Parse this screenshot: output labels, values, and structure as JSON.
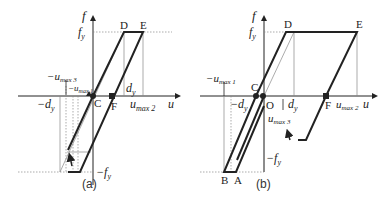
{
  "panels": [
    {
      "caption": "(a)",
      "axis_labels": {
        "f": "f",
        "u": "u",
        "fy": "f",
        "fy_sub": "y",
        "neg_fy": "−f",
        "neg_fy_sub": "y"
      },
      "points": {
        "D": "D",
        "E": "E",
        "C": "C",
        "F": "F"
      },
      "labels": {
        "neg_umax3": "−u",
        "neg_umax3_sub": "max 3",
        "neg_umax1": "−u",
        "neg_umax1_sub": "max 1",
        "neg_dy": "−d",
        "neg_dy_sub": "y",
        "dy": "d",
        "dy_sub": "y",
        "umax2": "u",
        "umax2_sub": "max 2"
      }
    },
    {
      "caption": "(b)",
      "axis_labels": {
        "f": "f",
        "u": "u",
        "fy": "f",
        "fy_sub": "y",
        "neg_fy": "−f",
        "neg_fy_sub": "y"
      },
      "points": {
        "D": "D",
        "E": "E",
        "C": "C",
        "O": "O",
        "F": "F",
        "B": "B",
        "A": "A"
      },
      "labels": {
        "neg_umax1": "−u",
        "neg_umax1_sub": "max 1",
        "neg_dy": "−d",
        "neg_dy_sub": "y",
        "dy": "d",
        "dy_sub": "y",
        "umax3": "u",
        "umax3_sub": "max 3",
        "umax2": "u",
        "umax2_sub": "max 2"
      }
    }
  ],
  "colors": {
    "line": "#222222",
    "guide": "#888888"
  }
}
